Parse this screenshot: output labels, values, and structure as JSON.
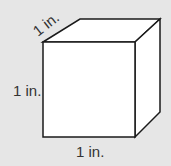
{
  "diagram": {
    "type": "unit-cube",
    "labels": {
      "depth": "1 in.",
      "height": "1 in.",
      "width": "1 in."
    },
    "colors": {
      "background": "#e6e6e6",
      "face": "#ffffff",
      "edge": "#1a1a1a",
      "text": "#333333"
    }
  }
}
